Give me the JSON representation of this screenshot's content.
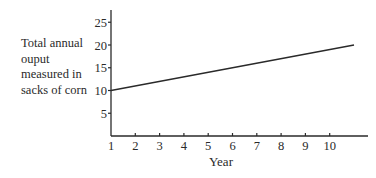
{
  "chart_data": {
    "type": "line",
    "title": "",
    "xlabel": "Year",
    "ylabel_lines": [
      "Total annual",
      "ouput",
      "measured in",
      "sacks of corn"
    ],
    "ylabel": "Total annual ouput measured in sacks of corn",
    "x_ticks": [
      1,
      2,
      3,
      4,
      5,
      6,
      7,
      8,
      9,
      10
    ],
    "y_ticks": [
      5,
      10,
      15,
      20,
      25
    ],
    "xlim": [
      1,
      12.3
    ],
    "ylim": [
      0,
      27.5
    ],
    "grid": false,
    "legend": null,
    "series": [
      {
        "name": "Total annual output",
        "x": [
          1,
          11
        ],
        "values": [
          10,
          20
        ]
      }
    ],
    "line_color": "#2a2a2a"
  }
}
